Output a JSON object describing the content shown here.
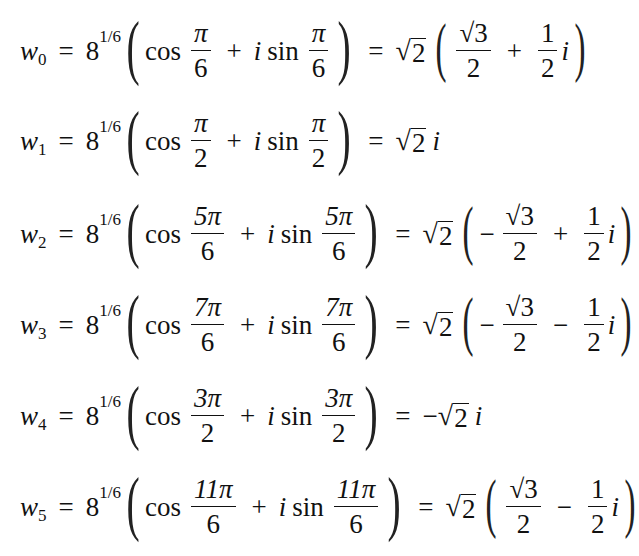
{
  "common": {
    "base": "8",
    "exponent": "1/6",
    "cos": "cos",
    "sin": "sin",
    "i": "i",
    "pi": "π",
    "eq": "=",
    "plus": "+",
    "minus": "−",
    "sqrt2": "2",
    "sqrt3": "3",
    "w": "w"
  },
  "equations": [
    {
      "label_sub": "0",
      "angle_num": "π",
      "angle_den": "6",
      "result": {
        "type": "paren",
        "sign1": "",
        "sign2": "+",
        "frac1_num": "√3",
        "frac1_den": "2",
        "frac2_num": "1",
        "frac2_den": "2"
      }
    },
    {
      "label_sub": "1",
      "angle_num": "π",
      "angle_den": "2",
      "result": {
        "type": "simple",
        "text": "√2 i"
      }
    },
    {
      "label_sub": "2",
      "angle_num": "5π",
      "angle_den": "6",
      "result": {
        "type": "paren",
        "sign1": "−",
        "sign2": "+",
        "frac1_num": "√3",
        "frac1_den": "2",
        "frac2_num": "1",
        "frac2_den": "2"
      }
    },
    {
      "label_sub": "3",
      "angle_num": "7π",
      "angle_den": "6",
      "result": {
        "type": "paren",
        "sign1": "−",
        "sign2": "−",
        "frac1_num": "√3",
        "frac1_den": "2",
        "frac2_num": "1",
        "frac2_den": "2"
      }
    },
    {
      "label_sub": "4",
      "angle_num": "3π",
      "angle_den": "2",
      "result": {
        "type": "simple",
        "text": "−√2 i"
      }
    },
    {
      "label_sub": "5",
      "angle_num": "11π",
      "angle_den": "6",
      "result": {
        "type": "paren",
        "sign1": "",
        "sign2": "−",
        "frac1_num": "√3",
        "frac1_den": "2",
        "frac2_num": "1",
        "frac2_den": "2"
      }
    }
  ]
}
